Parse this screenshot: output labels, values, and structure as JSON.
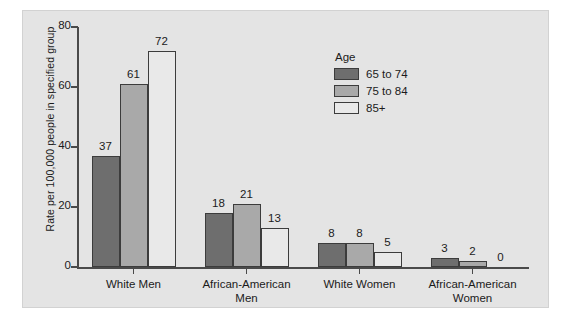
{
  "chart_data": {
    "type": "bar",
    "title": "",
    "xlabel": "",
    "ylabel": "Rate per 100,000 people in specified group",
    "ylim": [
      0,
      80
    ],
    "yticks": [
      0,
      20,
      40,
      60,
      80
    ],
    "ytick_labels": [
      "0",
      "20",
      "40",
      "60",
      "80"
    ],
    "grid": false,
    "legend_title": "Age",
    "legend_position": "inside upper-right",
    "categories": [
      "White Men",
      "African-American\nMen",
      "White Women",
      "African-American\nWomen"
    ],
    "series": [
      {
        "name": "65 to 74",
        "color": "#6e6e6e",
        "values": [
          37,
          18,
          8,
          3
        ],
        "labels": [
          "37",
          "18",
          "8",
          "3"
        ]
      },
      {
        "name": "75 to 84",
        "color": "#a9a9a9",
        "values": [
          61,
          21,
          8,
          2
        ],
        "labels": [
          "61",
          "21",
          "8",
          "2"
        ]
      },
      {
        "name": "85+",
        "color": "#e9e9e9",
        "values": [
          72,
          13,
          5,
          0
        ],
        "labels": [
          "72",
          "13",
          "5",
          "0"
        ]
      }
    ],
    "colors": {
      "panel_background": "#e4e4e4",
      "axis": "#4a4a4a",
      "bar_outline": "#3c3c3c",
      "text": "#1b1b1b"
    }
  }
}
